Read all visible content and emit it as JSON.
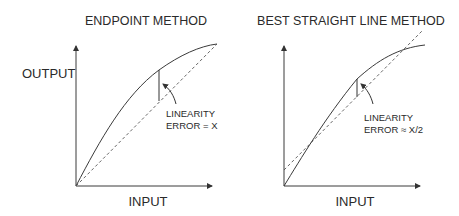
{
  "diagram": {
    "panels": [
      {
        "title": "ENDPOINT METHOD",
        "y_label": "OUTPUT",
        "x_label": "INPUT",
        "annotation_line1": "LINEARITY",
        "annotation_line2": "ERROR = X"
      },
      {
        "title": "BEST STRAIGHT LINE METHOD",
        "y_label": "",
        "x_label": "INPUT",
        "annotation_line1": "LINEARITY",
        "annotation_line2": "ERROR ≈ X/2"
      }
    ],
    "legend": {
      "solid_line": "actual output curve",
      "dashed_line": "reference straight line"
    }
  }
}
